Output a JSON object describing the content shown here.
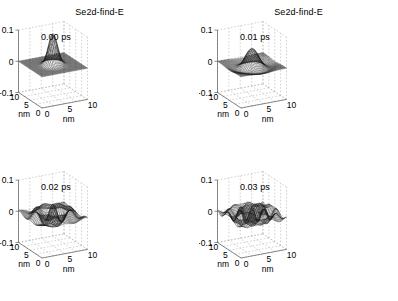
{
  "figure": {
    "background": "#ffffff",
    "layout": "2x2 grid of 3D mesh surface plots",
    "panel_order": [
      "top-left",
      "top-right",
      "bottom-left",
      "bottom-right"
    ]
  },
  "common": {
    "zlabel": "Real(Psi)",
    "z_ticks": [
      "0.1",
      "0",
      "-0.1"
    ],
    "z_tick_values": [
      0.1,
      0,
      -0.1
    ],
    "zlim": [
      -0.1,
      0.1
    ],
    "x_ticks": [
      "0",
      "5",
      "10"
    ],
    "x_tick_values": [
      0,
      5,
      10
    ],
    "y_ticks": [
      "10",
      "5",
      "0"
    ],
    "y_tick_values": [
      10,
      5,
      0
    ],
    "xlabel": "nm",
    "ylabel": "nm",
    "xlim": [
      0,
      10
    ],
    "ylim": [
      0,
      10
    ],
    "grid": "on",
    "grid_color": "#b4b4b4",
    "axis_color": "#5a5a5a",
    "mesh_color": "#1a1a1a"
  },
  "panels": [
    {
      "id": "panel-0",
      "title": "Se2d-find-E",
      "time_label": "0.00 ps",
      "time_value": 0.0,
      "time_unit": "ps",
      "surface": "sharp single gaussian peak at center, flat dark base"
    },
    {
      "id": "panel-1",
      "title": "Se2d-find-E",
      "time_label": "0.01 ps",
      "time_value": 0.01,
      "time_unit": "ps",
      "surface": "broad low dome, spread wavepacket on flat base"
    },
    {
      "id": "panel-2",
      "title": "",
      "time_label": "0.02 ps",
      "time_value": 0.02,
      "time_unit": "ps",
      "surface": "rippled interference pattern, multiple low peaks and troughs"
    },
    {
      "id": "panel-3",
      "title": "",
      "time_label": "0.03 ps",
      "time_value": 0.03,
      "time_unit": "ps",
      "surface": "fine multi-lobe ripple pattern spanning full domain"
    }
  ],
  "chart_data": {
    "type": "line",
    "subtype": "3d-mesh-surface",
    "title": "Se2d-find-E",
    "xlabel": "nm",
    "ylabel": "nm",
    "zlabel": "Real(Psi)",
    "xlim": [
      0,
      10
    ],
    "ylim": [
      0,
      10
    ],
    "zlim": [
      -0.1,
      0.1
    ],
    "xticks": [
      0,
      5,
      10
    ],
    "yticks": [
      0,
      5,
      10
    ],
    "zticks": [
      -0.1,
      0,
      0.1
    ],
    "grid": true,
    "legend": "none",
    "annotations": [
      "0.00 ps",
      "0.01 ps",
      "0.02 ps",
      "0.03 ps"
    ],
    "series": [
      {
        "name": "0.00 ps",
        "description": "Gaussian wavepacket, amplitude 0.10 at (5,5), sigma 0.9 nm",
        "amplitude": 0.1,
        "center": [
          5,
          5
        ],
        "sigma": 0.9,
        "k": 0
      },
      {
        "name": "0.01 ps",
        "description": "Spread dome, amplitude 0.045, sigma 2.2 nm",
        "amplitude": 0.045,
        "center": [
          5,
          5
        ],
        "sigma": 2.2,
        "k": 0.35
      },
      {
        "name": "0.02 ps",
        "description": "Rippled interference, amplitude 0.030, sigma 3.4 nm",
        "amplitude": 0.03,
        "center": [
          5,
          5
        ],
        "sigma": 3.4,
        "k": 0.85
      },
      {
        "name": "0.03 ps",
        "description": "Multi-lobe ripples, amplitude 0.024, sigma 4.4 nm",
        "amplitude": 0.024,
        "center": [
          5,
          5
        ],
        "sigma": 4.4,
        "k": 1.25
      }
    ]
  }
}
